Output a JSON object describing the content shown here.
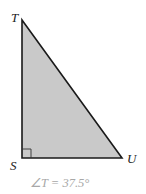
{
  "diagram": {
    "type": "right-triangle",
    "vertices": {
      "T": {
        "label": "T",
        "x": 22,
        "y": 20
      },
      "S": {
        "label": "S",
        "x": 22,
        "y": 158
      },
      "U": {
        "label": "U",
        "x": 122,
        "y": 158
      }
    },
    "right_angle_at": "S",
    "caption": "∠T = 37.5°",
    "colors": {
      "fill": "#c9c9c9",
      "stroke": "#1a1a1a",
      "caption": "#a8a8a8"
    }
  }
}
